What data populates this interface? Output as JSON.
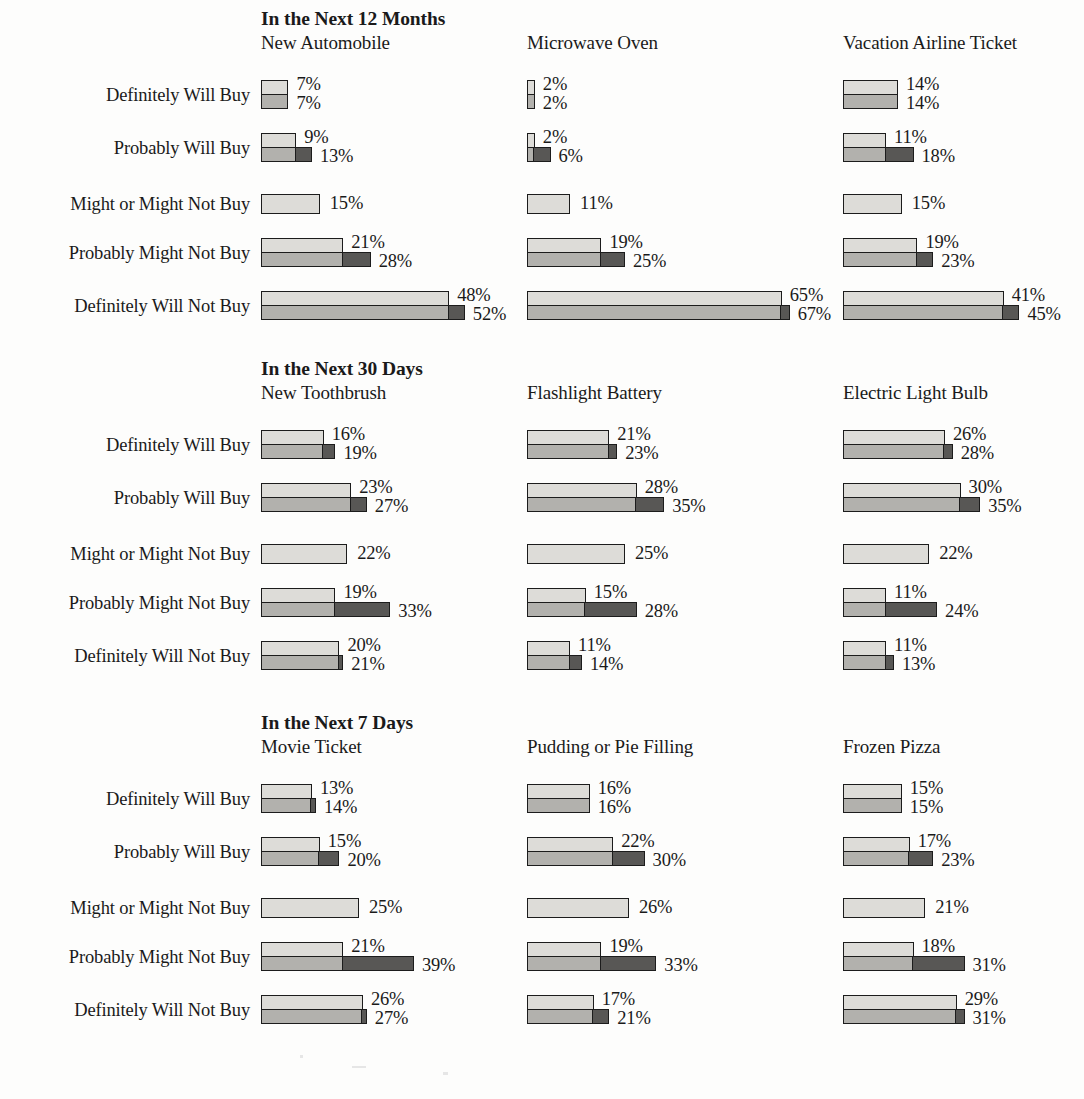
{
  "chart_data": {
    "type": "bar",
    "xlabel": "",
    "ylabel": "",
    "xlim": [
      0,
      70
    ],
    "grid": false,
    "legend": "none",
    "orientation": "horizontal",
    "value_suffix": "%",
    "px_per_percent": 3.92,
    "series": [
      {
        "name": "stated-intent",
        "color": "#dddcd8",
        "role": "upper light bar"
      },
      {
        "name": "actual-base",
        "color": "#b2b1ad",
        "role": "lower medium bar"
      },
      {
        "name": "actual-extension",
        "color": "#585755",
        "role": "dark extension beyond stated intent"
      }
    ],
    "row_categories": [
      "Definitely Will Buy",
      "Probably Will Buy",
      "Might or Might Not Buy",
      "Probably Might Not Buy",
      "Definitely Will Not Buy"
    ],
    "sections": [
      {
        "title": "In the Next 12 Months",
        "columns": [
          {
            "name": "New Automobile",
            "rows": [
              {
                "label": "Definitely Will Buy",
                "upper": 7,
                "lower": 7,
                "single": false
              },
              {
                "label": "Probably Will Buy",
                "upper": 9,
                "lower": 13,
                "single": false
              },
              {
                "label": "Might or Might Not Buy",
                "upper": 15,
                "lower": null,
                "single": true
              },
              {
                "label": "Probably Might Not Buy",
                "upper": 21,
                "lower": 28,
                "single": false
              },
              {
                "label": "Definitely Will Not Buy",
                "upper": 48,
                "lower": 52,
                "single": false
              }
            ]
          },
          {
            "name": "Microwave Oven",
            "rows": [
              {
                "label": "Definitely Will Buy",
                "upper": 2,
                "lower": 2,
                "single": false
              },
              {
                "label": "Probably Will Buy",
                "upper": 2,
                "lower": 6,
                "single": false
              },
              {
                "label": "Might or Might Not Buy",
                "upper": 11,
                "lower": null,
                "single": true
              },
              {
                "label": "Probably Might Not Buy",
                "upper": 19,
                "lower": 25,
                "single": false
              },
              {
                "label": "Definitely Will Not Buy",
                "upper": 65,
                "lower": 67,
                "single": false
              }
            ]
          },
          {
            "name": "Vacation Airline Ticket",
            "rows": [
              {
                "label": "Definitely Will Buy",
                "upper": 14,
                "lower": 14,
                "single": false
              },
              {
                "label": "Probably Will Buy",
                "upper": 11,
                "lower": 18,
                "single": false
              },
              {
                "label": "Might or Might Not Buy",
                "upper": 15,
                "lower": null,
                "single": true
              },
              {
                "label": "Probably Might Not Buy",
                "upper": 19,
                "lower": 23,
                "single": false
              },
              {
                "label": "Definitely Will Not Buy",
                "upper": 41,
                "lower": 45,
                "single": false
              }
            ]
          }
        ]
      },
      {
        "title": "In the Next 30 Days",
        "columns": [
          {
            "name": "New Toothbrush",
            "rows": [
              {
                "label": "Definitely Will Buy",
                "upper": 16,
                "lower": 19,
                "single": false
              },
              {
                "label": "Probably Will Buy",
                "upper": 23,
                "lower": 27,
                "single": false
              },
              {
                "label": "Might or Might Not Buy",
                "upper": 22,
                "lower": null,
                "single": true
              },
              {
                "label": "Probably Might Not Buy",
                "upper": 19,
                "lower": 33,
                "single": false
              },
              {
                "label": "Definitely Will Not Buy",
                "upper": 20,
                "lower": 21,
                "single": false
              }
            ]
          },
          {
            "name": "Flashlight Battery",
            "rows": [
              {
                "label": "Definitely Will Buy",
                "upper": 21,
                "lower": 23,
                "single": false
              },
              {
                "label": "Probably Will Buy",
                "upper": 28,
                "lower": 35,
                "single": false
              },
              {
                "label": "Might or Might Not Buy",
                "upper": 25,
                "lower": null,
                "single": true
              },
              {
                "label": "Probably Might Not Buy",
                "upper": 15,
                "lower": 28,
                "single": false
              },
              {
                "label": "Definitely Will Not Buy",
                "upper": 11,
                "lower": 14,
                "single": false
              }
            ]
          },
          {
            "name": "Electric Light Bulb",
            "rows": [
              {
                "label": "Definitely Will Buy",
                "upper": 26,
                "lower": 28,
                "single": false
              },
              {
                "label": "Probably Will Buy",
                "upper": 30,
                "lower": 35,
                "single": false
              },
              {
                "label": "Might or Might Not Buy",
                "upper": 22,
                "lower": null,
                "single": true
              },
              {
                "label": "Probably Might Not Buy",
                "upper": 11,
                "lower": 24,
                "single": false
              },
              {
                "label": "Definitely Will Not Buy",
                "upper": 11,
                "lower": 13,
                "single": false
              }
            ]
          }
        ]
      },
      {
        "title": "In the Next 7 Days",
        "columns": [
          {
            "name": "Movie Ticket",
            "rows": [
              {
                "label": "Definitely Will Buy",
                "upper": 13,
                "lower": 14,
                "single": false
              },
              {
                "label": "Probably Will Buy",
                "upper": 15,
                "lower": 20,
                "single": false
              },
              {
                "label": "Might or Might Not Buy",
                "upper": 25,
                "lower": null,
                "single": true
              },
              {
                "label": "Probably Might Not Buy",
                "upper": 21,
                "lower": 39,
                "single": false
              },
              {
                "label": "Definitely Will Not Buy",
                "upper": 26,
                "lower": 27,
                "single": false
              }
            ]
          },
          {
            "name": "Pudding or Pie Filling",
            "rows": [
              {
                "label": "Definitely Will Buy",
                "upper": 16,
                "lower": 16,
                "single": false
              },
              {
                "label": "Probably Will Buy",
                "upper": 22,
                "lower": 30,
                "single": false
              },
              {
                "label": "Might or Might Not Buy",
                "upper": 26,
                "lower": null,
                "single": true
              },
              {
                "label": "Probably Might Not Buy",
                "upper": 19,
                "lower": 33,
                "single": false
              },
              {
                "label": "Definitely Will Not Buy",
                "upper": 17,
                "lower": 21,
                "single": false
              }
            ]
          },
          {
            "name": "Frozen Pizza",
            "rows": [
              {
                "label": "Definitely Will Buy",
                "upper": 15,
                "lower": 15,
                "single": false
              },
              {
                "label": "Probably Will Buy",
                "upper": 17,
                "lower": 23,
                "single": false
              },
              {
                "label": "Might or Might Not Buy",
                "upper": 21,
                "lower": null,
                "single": true
              },
              {
                "label": "Probably Might Not Buy",
                "upper": 18,
                "lower": 31,
                "single": false
              },
              {
                "label": "Definitely Will Not Buy",
                "upper": 29,
                "lower": 31,
                "single": false
              }
            ]
          }
        ]
      }
    ]
  },
  "layout": {
    "column_x": [
      261,
      527,
      843
    ],
    "section_top": [
      8,
      358,
      712
    ],
    "row_offsets": [
      72,
      125,
      186,
      230,
      283
    ]
  }
}
